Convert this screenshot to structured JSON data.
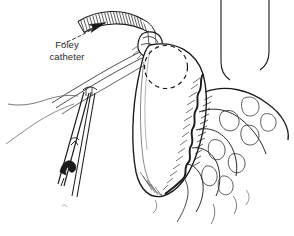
{
  "figure": {
    "kind": "medical-line-illustration",
    "background_color": "#ffffff",
    "ink_color": "#1a1a1a",
    "text_color": "#2b2b2b",
    "width": 294,
    "height": 236
  },
  "annotations": {
    "foley_label_line1": "Foley",
    "foley_label_line2": "catheter"
  },
  "parts": {
    "catheter_tube": "corrugated-catheter-tube",
    "leader_arrow": "dashed-leader-arrow",
    "balloon": "dashed-balloon-circle",
    "knot": "purse-string-knot",
    "organ": "stomach-wall",
    "omentum": "omental-fat",
    "forceps": "surgical-forceps",
    "sutures": "suture-threads",
    "retractors": "retractor-blades"
  }
}
